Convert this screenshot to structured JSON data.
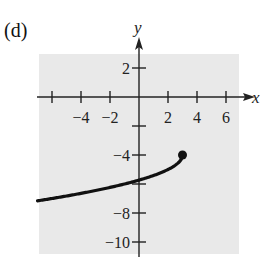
{
  "panel_label": "(d)",
  "chart_data": {
    "type": "line",
    "title": "",
    "xlabel": "x",
    "ylabel": "y",
    "xlim": [
      -7,
      7.5
    ],
    "ylim": [
      -11,
      3
    ],
    "grid": false,
    "background": "#e9e9e9",
    "x_ticks": [
      -6,
      -4,
      -2,
      2,
      4,
      6
    ],
    "x_tick_labels": [
      {
        "value": -4,
        "label": "−4"
      },
      {
        "value": -2,
        "label": "−2"
      },
      {
        "value": 2,
        "label": "2"
      },
      {
        "value": 4,
        "label": "4"
      },
      {
        "value": 6,
        "label": "6"
      }
    ],
    "y_ticks": [
      2,
      -2,
      -4,
      -6,
      -8,
      -10
    ],
    "y_tick_labels": [
      {
        "value": 2,
        "label": "2"
      },
      {
        "value": -4,
        "label": "−4"
      },
      {
        "value": -8,
        "label": "−8"
      },
      {
        "value": -10,
        "label": "−10"
      }
    ],
    "series": [
      {
        "name": "curve",
        "function": "y = -sqrt(3 - x) - 4",
        "x_range": [
          -7,
          3
        ],
        "color": "#111111"
      }
    ],
    "endpoint": {
      "x": 3,
      "y": -4,
      "filled": true
    }
  }
}
